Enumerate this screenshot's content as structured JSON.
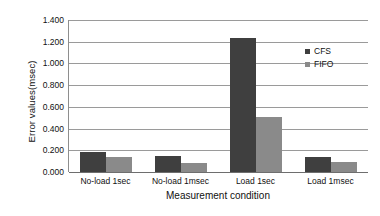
{
  "chart_data": {
    "type": "bar",
    "title": "",
    "xlabel": "Measurement condition",
    "ylabel": "Error values(msec)",
    "categories": [
      "No-load 1sec",
      "No-load 1msec",
      "Load 1sec",
      "Load 1msec"
    ],
    "series": [
      {
        "name": "CFS",
        "color": "#3f3f3f",
        "values": [
          0.185,
          0.145,
          1.235,
          0.138
        ]
      },
      {
        "name": "FIFO",
        "color": "#8a8a8a",
        "values": [
          0.138,
          0.085,
          0.505,
          0.092
        ]
      }
    ],
    "ylim": [
      0.0,
      1.4
    ],
    "ytick_labels": [
      "0.000",
      "0.200",
      "0.400",
      "0.600",
      "0.800",
      "1.000",
      "1.200",
      "1.400"
    ],
    "ytick_values": [
      0.0,
      0.2,
      0.4,
      0.6,
      0.8,
      1.0,
      1.2,
      1.4
    ],
    "grid": true,
    "legend_position": "inside-top-right"
  }
}
